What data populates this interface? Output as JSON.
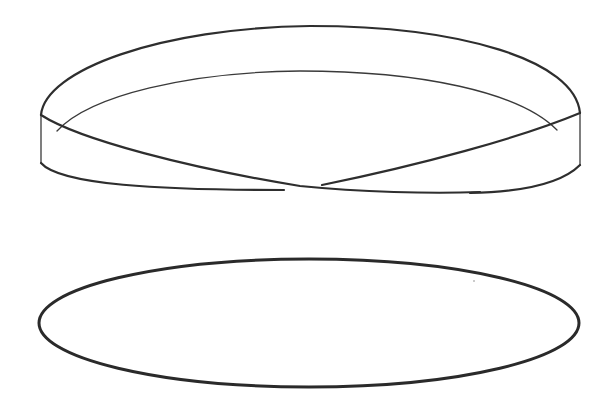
{
  "figure": {
    "background_color": "#ffffff",
    "stroke_color": "#2a2a2a",
    "shapes": [
      {
        "name": "twisted-band",
        "label": ""
      },
      {
        "name": "flat-ellipse",
        "label": ""
      }
    ]
  }
}
